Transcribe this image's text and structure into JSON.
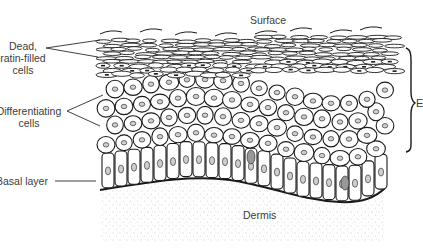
{
  "diagram": {
    "labels": {
      "surface": "Surface",
      "dermis": "Dermis",
      "dead_cells": [
        "Dead,",
        "eratin-filled",
        "cells"
      ],
      "differentiating_cells": [
        "Differentiating",
        "cells"
      ],
      "basal_layer": "Basal layer",
      "bracket_label": "E"
    },
    "colors": {
      "ink": "#1a1a1a",
      "label_text": "#3c3c3c",
      "dermis_stipple": "#9a9a9a",
      "background": "#ffffff"
    },
    "layers": [
      {
        "name": "stratum corneum (dead keratin-filled cells)",
        "rows": 4
      },
      {
        "name": "differentiating cells",
        "rows": 4
      },
      {
        "name": "basal layer",
        "rows": 1
      },
      {
        "name": "dermis",
        "rows": 0
      }
    ]
  }
}
